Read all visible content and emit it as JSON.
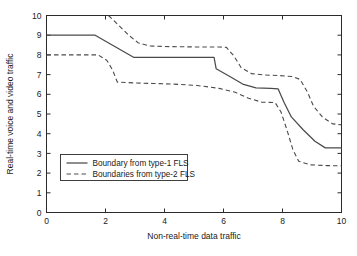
{
  "chart_data": {
    "type": "line",
    "title": "",
    "xlabel": "Non-real-time data traffic",
    "ylabel": "Real-time voice and video traffic",
    "xlim": [
      0,
      10
    ],
    "ylim": [
      0,
      10
    ],
    "xticks": [
      0,
      2,
      4,
      6,
      8,
      10
    ],
    "yticks": [
      0,
      1,
      2,
      3,
      4,
      5,
      6,
      7,
      8,
      9,
      10
    ],
    "xticklabels": [
      "0",
      "2",
      "4",
      "6",
      "8",
      "10"
    ],
    "yticklabels": [
      "0",
      "1",
      "2",
      "3",
      "4",
      "5",
      "6",
      "7",
      "8",
      "9",
      "10"
    ],
    "grid": false,
    "legend_position": "center-left",
    "series": [
      {
        "name": "Boundary from type-1 FLS",
        "style": "solid",
        "points": [
          [
            0.0,
            9.0
          ],
          [
            1.65,
            9.0
          ],
          [
            1.9,
            8.78
          ],
          [
            2.95,
            7.88
          ],
          [
            5.68,
            7.88
          ],
          [
            5.75,
            7.3
          ],
          [
            6.2,
            6.92
          ],
          [
            6.65,
            6.52
          ],
          [
            7.1,
            6.33
          ],
          [
            7.6,
            6.3
          ],
          [
            7.85,
            6.28
          ],
          [
            8.05,
            5.6
          ],
          [
            8.3,
            4.85
          ],
          [
            8.7,
            4.2
          ],
          [
            9.1,
            3.62
          ],
          [
            9.45,
            3.28
          ],
          [
            10.0,
            3.28
          ]
        ]
      },
      {
        "name": "Boundaries from type-2 FLS (upper)",
        "style": "dashed",
        "points": [
          [
            2.1,
            10.0
          ],
          [
            2.45,
            9.5
          ],
          [
            2.75,
            9.05
          ],
          [
            3.1,
            8.62
          ],
          [
            3.5,
            8.45
          ],
          [
            4.2,
            8.42
          ],
          [
            5.2,
            8.4
          ],
          [
            5.85,
            8.4
          ],
          [
            6.1,
            8.38
          ],
          [
            6.35,
            7.95
          ],
          [
            6.6,
            7.35
          ],
          [
            6.95,
            7.05
          ],
          [
            7.4,
            6.98
          ],
          [
            7.9,
            6.95
          ],
          [
            8.35,
            6.9
          ],
          [
            8.6,
            6.75
          ],
          [
            8.85,
            6.1
          ],
          [
            9.05,
            5.4
          ],
          [
            9.35,
            4.85
          ],
          [
            9.7,
            4.5
          ],
          [
            10.0,
            4.45
          ]
        ]
      },
      {
        "name": "Boundaries from type-2 FLS (lower)",
        "style": "dashed",
        "points": [
          [
            0.0,
            8.0
          ],
          [
            1.75,
            8.0
          ],
          [
            2.05,
            7.72
          ],
          [
            2.25,
            7.2
          ],
          [
            2.4,
            6.62
          ],
          [
            2.95,
            6.58
          ],
          [
            3.6,
            6.55
          ],
          [
            4.3,
            6.52
          ],
          [
            5.1,
            6.45
          ],
          [
            5.85,
            6.3
          ],
          [
            6.4,
            6.1
          ],
          [
            6.85,
            5.8
          ],
          [
            7.3,
            5.6
          ],
          [
            7.75,
            5.58
          ],
          [
            7.95,
            5.1
          ],
          [
            8.15,
            4.2
          ],
          [
            8.35,
            3.2
          ],
          [
            8.55,
            2.6
          ],
          [
            8.95,
            2.42
          ],
          [
            9.5,
            2.38
          ],
          [
            10.0,
            2.37
          ]
        ]
      }
    ],
    "legend": [
      {
        "label": "Boundary from type-1 FLS",
        "style": "solid"
      },
      {
        "label": "Boundaries from type-2 FLS",
        "style": "dashed"
      }
    ],
    "colors": {
      "line": "#4a4a4a",
      "axis": "#2b2b2b",
      "background": "#ffffff"
    }
  }
}
